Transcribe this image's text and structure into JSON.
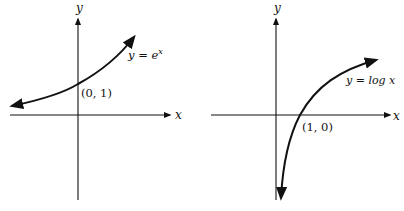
{
  "figures": [
    {
      "name": "exponential",
      "axis_x_label": "x",
      "axis_y_label": "y",
      "equation_prefix": "y = e",
      "equation_exp": "x",
      "point_label": "(0, 1)"
    },
    {
      "name": "logarithm",
      "axis_x_label": "x",
      "axis_y_label": "y",
      "equation": "y = log x",
      "point_label": "(1, 0)"
    }
  ],
  "colors": {
    "ink": "#111111",
    "background": "#ffffff"
  }
}
